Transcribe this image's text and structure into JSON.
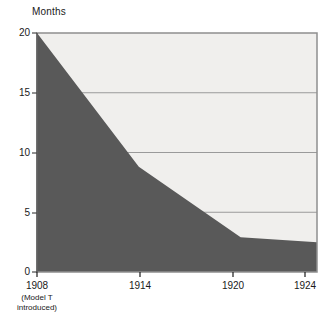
{
  "chart_data": {
    "type": "area",
    "title": "",
    "subtitle": "",
    "xlabel": "",
    "ylabel": "Months",
    "xlim": [
      1908,
      1924.5
    ],
    "ylim": [
      0,
      20
    ],
    "grid": true,
    "legend": false,
    "x_ticks": [
      1908,
      1914,
      1920,
      1924
    ],
    "x_tick_labels": [
      "1908",
      "1914",
      "1920",
      "1924"
    ],
    "x_tick_sublabels": [
      "(Model T\nintroduced)",
      "",
      "",
      ""
    ],
    "y_ticks": [
      0,
      5,
      10,
      15,
      20
    ],
    "y_tick_labels": [
      "0",
      "5",
      "10",
      "15",
      "20"
    ],
    "series": [
      {
        "name": "Months",
        "x": [
          1908,
          1914,
          1920,
          1924.5
        ],
        "values": [
          20,
          8.8,
          2.9,
          2.5
        ]
      }
    ],
    "colors": {
      "area_fill": "#595959",
      "plot_background": "#f0efed",
      "gridline": "#9a9a9a",
      "plot_border": "#8f8f8f",
      "text": "#1a1a1a"
    }
  },
  "axis": {
    "y_title": "Months",
    "y_labels": [
      "20",
      "15",
      "10",
      "5",
      "0"
    ],
    "x_labels": [
      "1908",
      "1914",
      "1920",
      "1924"
    ],
    "x_sublabel_line1": "(Model T",
    "x_sublabel_line2": "introduced)"
  }
}
